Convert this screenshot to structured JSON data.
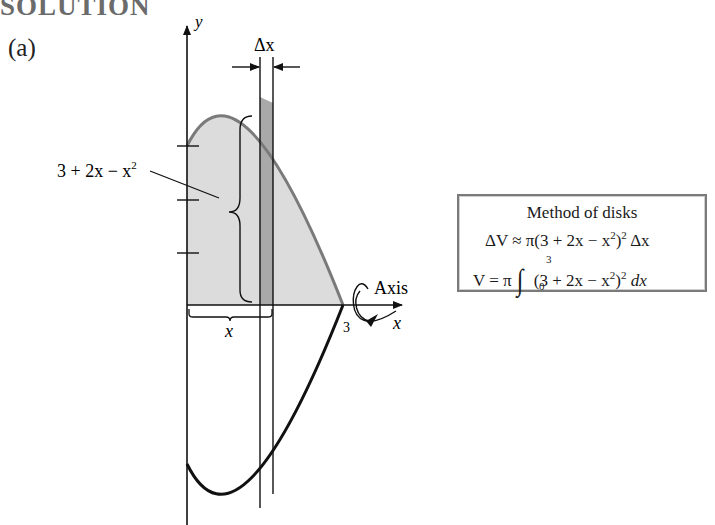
{
  "heading": "SOLUTION",
  "part_label": "(a)",
  "diagram": {
    "y_axis_label": "y",
    "x_axis_label": "x",
    "delta_x_label": "Δx",
    "function_label": "3 + 2x − x",
    "function_label_exp": "2",
    "x_brace_label": "x",
    "axis_label": "Axis",
    "x_intercept_label": "3",
    "y_ticks": [
      1,
      2,
      3
    ],
    "curve": "y = 3 + 2x - x^2, 0 <= x <= 3, reflected about x-axis",
    "colors": {
      "region_fill": "#dcdcdc",
      "strip_fill": "#a9a9a9",
      "top_curve": "#7a7a7a",
      "bottom_curve": "#111111",
      "box_border": "#7a7a7a"
    }
  },
  "method_box": {
    "title": "Method of disks",
    "eq1": {
      "lhs": "ΔV ≈ π(3 + 2x − x",
      "exp1": "2",
      "mid": ")",
      "exp2": "2",
      "rhs": " Δx"
    },
    "eq2": {
      "lhs": "V = π",
      "upper": "3",
      "lower": "0",
      "body": "(3 + 2x − x",
      "exp1": "2",
      "mid": ")",
      "exp2": "2",
      "rhs": " dx"
    }
  }
}
